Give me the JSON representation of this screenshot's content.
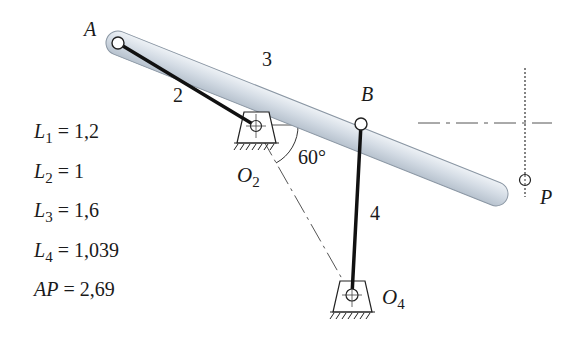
{
  "labels": {
    "point_A": "A",
    "point_B": "B",
    "point_P": "P",
    "pivot_O2_main": "O",
    "pivot_O2_sub": "2",
    "pivot_O4_main": "O",
    "pivot_O4_sub": "4",
    "link_2": "2",
    "link_3": "3",
    "link_4": "4",
    "angle": "60°"
  },
  "parameters": [
    {
      "symbol": "L",
      "sub": "1",
      "eq": " = ",
      "value": "1,2"
    },
    {
      "symbol": "L",
      "sub": "2",
      "eq": " = ",
      "value": "1"
    },
    {
      "symbol": "L",
      "sub": "3",
      "eq": " = ",
      "value": "1,6"
    },
    {
      "symbol": "L",
      "sub": "4",
      "eq": " = ",
      "value": "1,039"
    },
    {
      "symbol": "AP",
      "sub": "",
      "eq": " = ",
      "value": "2,69"
    }
  ],
  "colors": {
    "coupler_fill": "#d5dde6",
    "coupler_edge": "#8a96a3",
    "link_stroke": "#111111",
    "construction_line": "#555555"
  }
}
